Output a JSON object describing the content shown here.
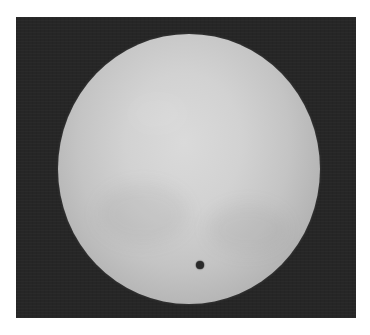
{
  "image": {
    "subject": "solar disk with transiting dark planet silhouette",
    "colors": {
      "page_background": "#ffffff",
      "frame_background": "#262626",
      "disk_center": "#dadada",
      "disk_limb": "#8a8a8a",
      "transit_spot": "#2a2a2a"
    },
    "frame": {
      "x": 16,
      "y": 17,
      "width": 340,
      "height": 301
    },
    "disk": {
      "center_x": 188.5,
      "center_y": 169,
      "radius_x": 131,
      "radius_y": 135
    },
    "spot": {
      "center_x": 200,
      "center_y": 265,
      "radius": 4
    }
  }
}
